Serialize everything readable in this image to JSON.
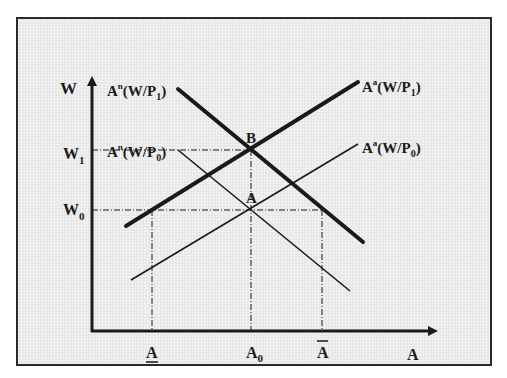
{
  "diagram": {
    "type": "labor-market supply/demand shift",
    "axes": {
      "y_label": "W",
      "x_label": "A"
    },
    "y_ticks": [
      {
        "id": "W1",
        "main": "W",
        "sub": "1"
      },
      {
        "id": "W0",
        "main": "W",
        "sub": "0"
      }
    ],
    "x_ticks": [
      {
        "id": "A_under",
        "main": "A",
        "decoration": "underline"
      },
      {
        "id": "A0",
        "main": "A",
        "sub": "0"
      },
      {
        "id": "A_bar",
        "main": "A",
        "decoration": "overbar"
      }
    ],
    "points": [
      {
        "label": "B"
      },
      {
        "label": "A"
      }
    ],
    "curves": [
      {
        "id": "An_P1",
        "base": "A",
        "sup": "n",
        "arg_pre": "(W/P",
        "arg_sub": "1",
        "arg_post": ")",
        "weight": "thick",
        "slope": "down"
      },
      {
        "id": "An_P0",
        "base": "A",
        "sup": "n",
        "arg_pre": "(W/P",
        "arg_sub": "0",
        "arg_post": ")",
        "weight": "thin",
        "slope": "down"
      },
      {
        "id": "Aa_P1",
        "base": "A",
        "sup": "a",
        "arg_pre": "(W/P",
        "arg_sub": "1",
        "arg_post": ")",
        "weight": "thick",
        "slope": "up"
      },
      {
        "id": "Aa_P0",
        "base": "A",
        "sup": "a",
        "arg_pre": "(W/P",
        "arg_sub": "0",
        "arg_post": ")",
        "weight": "thin",
        "slope": "up"
      }
    ],
    "colors": {
      "line": "#1a1a1a",
      "background": "#e6e6e6",
      "frame": "#2a2a2a"
    }
  }
}
